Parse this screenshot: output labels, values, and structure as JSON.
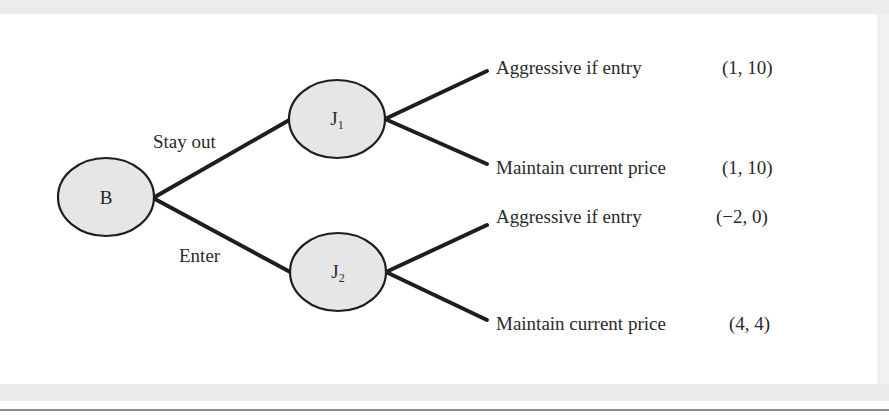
{
  "diagram": {
    "type": "game-tree",
    "nodes": [
      {
        "id": "B",
        "label": "B",
        "sub": ""
      },
      {
        "id": "J1",
        "label": "J",
        "sub": "1"
      },
      {
        "id": "J2",
        "label": "J",
        "sub": "2"
      }
    ],
    "edges": [
      {
        "from": "B",
        "to": "J1",
        "label": "Stay out"
      },
      {
        "from": "B",
        "to": "J2",
        "label": "Enter"
      }
    ],
    "leaves": [
      {
        "from": "J1",
        "action": "Aggressive if entry",
        "payoff": "(1, 10)"
      },
      {
        "from": "J1",
        "action": "Maintain current price",
        "payoff": "(1, 10)"
      },
      {
        "from": "J2",
        "action": "Aggressive if entry",
        "payoff": "(−2, 0)"
      },
      {
        "from": "J2",
        "action": "Maintain current price",
        "payoff": "(4, 4)"
      }
    ],
    "colors": {
      "node_fill": "#e6e6e6",
      "stroke": "#1e1e1e",
      "frame": "#ececec"
    }
  }
}
